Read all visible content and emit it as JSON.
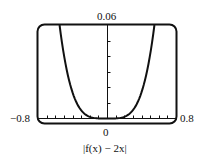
{
  "chart_data": {
    "type": "line",
    "title": "",
    "caption": "|f(x) − 2x|",
    "xlabel": "",
    "ylabel": "",
    "xlim": [
      -0.8,
      0.8
    ],
    "ylim": [
      0,
      0.06
    ],
    "x_tick_spacing": 0.1,
    "y_tick_spacing": 0.01,
    "tick_labels": {
      "x_min": "−0.8",
      "x_max": "0.8",
      "x_origin": "0",
      "y_max": "0.06"
    },
    "grid": false,
    "legend": null,
    "series": [
      {
        "name": "|f(x) − 2x|",
        "shape": "even quartic-like curve with minimum 0 at x=0",
        "x": [
          -0.55,
          -0.5,
          -0.4,
          -0.3,
          -0.2,
          -0.1,
          0,
          0.1,
          0.2,
          0.3,
          0.4,
          0.5,
          0.55
        ],
        "y": [
          0.06,
          0.045,
          0.025,
          0.011,
          0.003,
          0.0002,
          0,
          0.0002,
          0.003,
          0.011,
          0.025,
          0.045,
          0.06
        ]
      }
    ]
  },
  "labels": {
    "y_max": "0.06",
    "x_min": "−0.8",
    "x_max": "0.8",
    "x_origin": "0",
    "caption": "|f(x) − 2x|"
  }
}
